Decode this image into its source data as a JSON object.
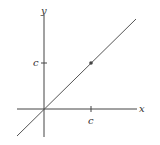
{
  "diagram": {
    "type": "coordinate-plot",
    "axes": {
      "x_label": "x",
      "y_label": "y",
      "x_tick_label": "c",
      "y_tick_label": "c"
    },
    "line": {
      "equation": "y = x",
      "color": "#555555"
    },
    "point": {
      "x": "c",
      "y": "c",
      "color": "#444444"
    },
    "colors": {
      "axis": "#444444",
      "text": "#333333"
    }
  }
}
